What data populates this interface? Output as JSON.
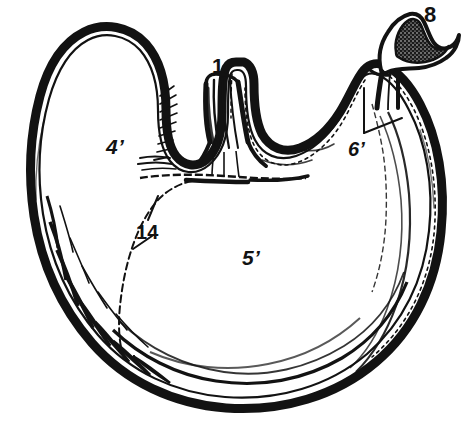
{
  "figure": {
    "kind": "anatomical-line-drawing",
    "background_color": "#ffffff",
    "ink_color": "#121212",
    "width": 473,
    "height": 424
  },
  "labels": [
    {
      "id": "1",
      "text": "1",
      "x": 212,
      "y": 55,
      "points_to": "esophagus-tube",
      "has_leader": false
    },
    {
      "id": "8",
      "text": "8",
      "x": 424,
      "y": 4,
      "points_to": "duodenum-cut-end",
      "has_leader": false
    },
    {
      "id": "6p",
      "text": "6’",
      "x": 348,
      "y": 139,
      "points_to": "pyloric-region",
      "has_leader": true
    },
    {
      "id": "4p",
      "text": "4’",
      "x": 106,
      "y": 136,
      "points_to": "fundus-cavity",
      "has_leader": false
    },
    {
      "id": "14",
      "text": "14",
      "x": 136,
      "y": 222,
      "points_to": "mucosal-boundary",
      "has_leader": true
    },
    {
      "id": "5p",
      "text": "5’",
      "x": 242,
      "y": 247,
      "points_to": "body-cavity",
      "has_leader": false
    }
  ],
  "leaders": {
    "six_prime_vertical": "from (364,88) to (364,133)",
    "six_prime_diagonal": "from (364,133) to (402,118)",
    "fourteen_upper": "from (158,196) to (147,221)",
    "fourteen_lower": "from (133,248) to (152,236)"
  }
}
